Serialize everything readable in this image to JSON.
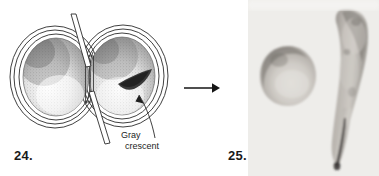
{
  "plate": {
    "width": 379,
    "height": 176,
    "background_color": "#ffffff",
    "ink_color": "#1a1a1a"
  },
  "figure_24": {
    "number": "24.",
    "caption_omitted": true,
    "type": "line-drawing",
    "subject": "amphibian egg constricted by a hair loop into two halves",
    "callout": {
      "line1": "Gray",
      "line2": "crescent"
    },
    "parts": {
      "left_half": "unpigmented egg half",
      "right_half": "egg half containing gray crescent",
      "crescent_color": "#3a3a3a",
      "membrane_layers": 3,
      "constriction_tool": "glass needles / hair loop"
    }
  },
  "transition": {
    "arrow": "arrow-right",
    "direction": "left-to-right"
  },
  "figure_25": {
    "number": "25.",
    "type": "photograph",
    "background_color": "#f2f1ef",
    "label": "Belly-piece",
    "specimens": [
      {
        "name": "Belly-piece",
        "shape": "rounded teardrop mass"
      },
      {
        "name": "tadpole",
        "shape": "elongated larva with tapering tail"
      }
    ]
  }
}
